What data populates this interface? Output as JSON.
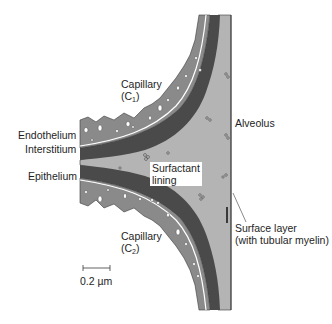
{
  "figure": {
    "labels": {
      "capillary_c1": "Capillary",
      "capillary_c1_sub": "(C",
      "capillary_c1_index": "1",
      "capillary_c2": "Capillary",
      "capillary_c2_sub": "(C",
      "capillary_c2_index": "2",
      "endothelium": "Endothelium",
      "interstitium": "Interstitium",
      "epithelium": "Epithelium",
      "alveolus": "Alveolus",
      "surfactant_line1": "Surfactant",
      "surfactant_line2": "lining",
      "surface_layer_line1": "Surface layer",
      "surface_layer_line2": "(with tubular myelin)",
      "scale_bar": "0.2 µm"
    },
    "colors": {
      "background": "#ffffff",
      "endothelium_capillary": "#8a8a8a",
      "interstitium_dark": "#4a4a4a",
      "epithelium_surfactant": "#b4b4b4",
      "membrane_line": "#ffffff",
      "outline": "#3a3a3a"
    }
  }
}
